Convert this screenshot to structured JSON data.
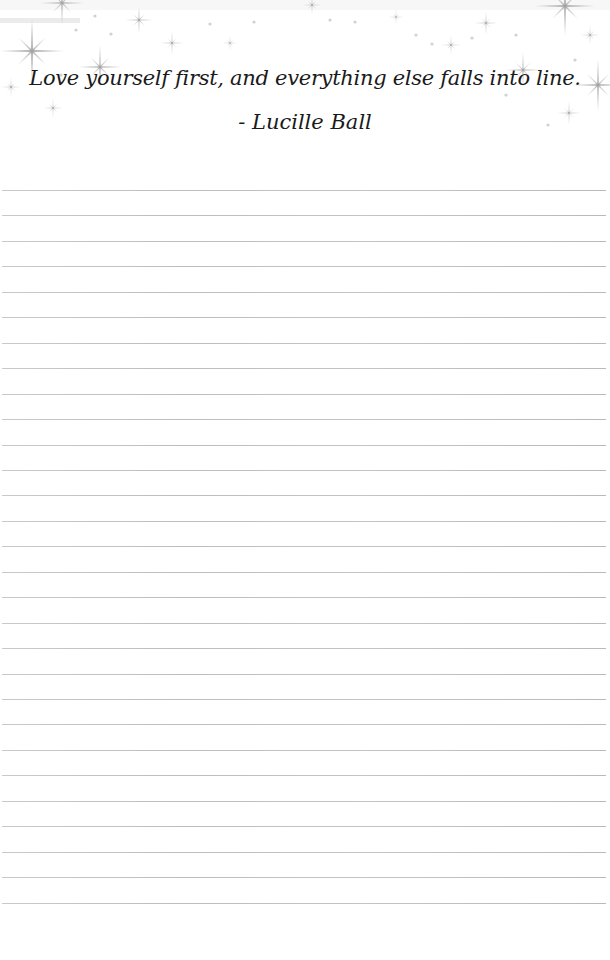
{
  "page": {
    "background": "#ffffff",
    "line_color": "#bdbdbd",
    "text_color": "#1a1a1a"
  },
  "header": {
    "decoration": "sparkle-stars",
    "quote": "Love yourself first, and everything else falls into line.",
    "author": "- Lucille Ball"
  },
  "ruled_lines": {
    "count": 29,
    "first_y": 190,
    "spacing": 25.45
  }
}
